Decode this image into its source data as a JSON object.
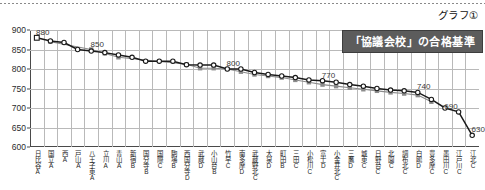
{
  "page": {
    "graph_number": "グラフ①",
    "banner_title": "「協議会校」の合格基準"
  },
  "chart_data": {
    "type": "line",
    "title": "「協議会校」の合格基準",
    "xlabel": "",
    "ylabel": "",
    "ylim": [
      600,
      900
    ],
    "yticks": [
      600,
      650,
      700,
      750,
      800,
      850,
      900
    ],
    "grid": true,
    "legend_position": "none",
    "categories": [
      "日比谷A",
      "国立A",
      "西A",
      "戸山A",
      "八王子東A",
      "立川A",
      "青山A",
      "新宿B",
      "国分寺B",
      "国際C",
      "駒場B",
      "西国分寺D",
      "武蔵D",
      "小山台B",
      "竹早C",
      "南多摩D",
      "武蔵野北C",
      "大泉D",
      "町田B",
      "三田C",
      "小松川C",
      "富士D",
      "小金井北C",
      "三鷹D",
      "城東C",
      "日野台C",
      "北園C",
      "調布北C",
      "白鴎D",
      "豊多摩C",
      "墨田川C",
      "江戸川C",
      "江北C"
    ],
    "series": [
      {
        "name": "合格基準（黒）",
        "color": "#1a1a1a",
        "marker": "open-square-circle",
        "values": [
          880,
          872,
          868,
          850,
          846,
          842,
          836,
          830,
          820,
          820,
          820,
          811,
          810,
          810,
          800,
          800,
          791,
          786,
          782,
          778,
          772,
          770,
          766,
          760,
          756,
          750,
          746,
          744,
          740,
          722,
          700,
          690,
          630
        ]
      },
      {
        "name": "参考基準（灰）",
        "color": "#8c8c8c",
        "marker": "filled-square",
        "values": [
          null,
          870,
          null,
          null,
          850,
          840,
          830,
          null,
          null,
          null,
          null,
          812,
          802,
          802,
          800,
          793,
          786,
          782,
          778,
          772,
          766,
          760,
          756,
          752,
          748,
          744,
          740,
          737,
          733,
          716,
          null,
          null,
          null
        ]
      }
    ],
    "point_labels": [
      {
        "index": 0,
        "value": 880,
        "text": "880"
      },
      {
        "index": 4,
        "value": 850,
        "text": "850"
      },
      {
        "index": 14,
        "value": 800,
        "text": "800"
      },
      {
        "index": 21,
        "value": 770,
        "text": "770"
      },
      {
        "index": 28,
        "value": 740,
        "text": "740"
      },
      {
        "index": 30,
        "value": 690,
        "text": "690"
      },
      {
        "index": 32,
        "value": 630,
        "text": "630"
      }
    ]
  },
  "colors": {
    "series_primary": "#1a1a1a",
    "series_secondary": "#8c8c8c",
    "grid": "#b9b9b9",
    "axis": "#4a4a4a",
    "banner_bg": "#5c5c5c",
    "banner_text": "#ffffff"
  }
}
